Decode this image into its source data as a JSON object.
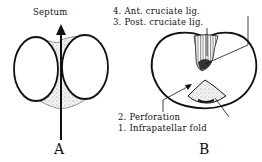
{
  "figure_a": {
    "label": "A",
    "septum_label": "Septum"
  },
  "figure_b": {
    "label": "B",
    "labels": {
      "ant_cruciate": "4. Ant. cruciate lig.",
      "post_cruciate": "3. Post. cruciate lig.",
      "perforation": "2. Perforation",
      "infrapatellar": "1. Infrapatellar fold"
    }
  },
  "colors": {
    "ink": "#111111",
    "background": "#ffffff",
    "stipple": "#888888"
  }
}
